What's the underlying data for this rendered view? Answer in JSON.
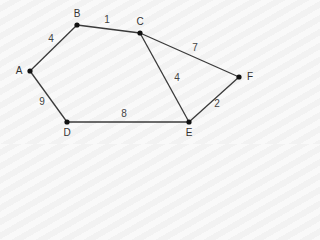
{
  "diagram": {
    "type": "weighted-undirected-graph",
    "colors": {
      "edge": "#3a3a3a",
      "node": "#111111",
      "label": "#333333",
      "background": "#f7f7f7"
    },
    "nodes": [
      {
        "id": "A",
        "label": "A",
        "x": 30,
        "y": 71,
        "label_x": 19,
        "label_y": 71
      },
      {
        "id": "B",
        "label": "B",
        "x": 77,
        "y": 25,
        "label_x": 77,
        "label_y": 14
      },
      {
        "id": "C",
        "label": "C",
        "x": 140,
        "y": 33,
        "label_x": 140,
        "label_y": 22
      },
      {
        "id": "D",
        "label": "D",
        "x": 67,
        "y": 122,
        "label_x": 67,
        "label_y": 133
      },
      {
        "id": "E",
        "label": "E",
        "x": 189,
        "y": 122,
        "label_x": 189,
        "label_y": 133
      },
      {
        "id": "F",
        "label": "F",
        "x": 239,
        "y": 77,
        "label_x": 250,
        "label_y": 77
      }
    ],
    "edges": [
      {
        "from": "A",
        "to": "B",
        "weight": "4",
        "label_x": 51,
        "label_y": 39
      },
      {
        "from": "B",
        "to": "C",
        "weight": "1",
        "label_x": 107,
        "label_y": 20
      },
      {
        "from": "C",
        "to": "F",
        "weight": "7",
        "label_x": 195,
        "label_y": 48
      },
      {
        "from": "C",
        "to": "E",
        "weight": "4",
        "label_x": 177,
        "label_y": 78
      },
      {
        "from": "E",
        "to": "F",
        "weight": "2",
        "label_x": 217,
        "label_y": 104
      },
      {
        "from": "A",
        "to": "D",
        "weight": "9",
        "label_x": 42,
        "label_y": 102
      },
      {
        "from": "D",
        "to": "E",
        "weight": "8",
        "label_x": 124,
        "label_y": 114
      }
    ]
  }
}
